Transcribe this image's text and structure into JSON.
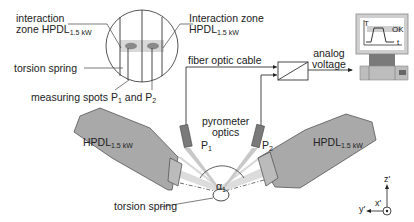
{
  "diagram": {
    "type": "laser welding setup schematic",
    "labels": {
      "interaction_zone_left": "interaction",
      "interaction_zone_left_2": "zone HPDL",
      "interaction_zone_left_sub": "1.5 kW",
      "interaction_zone_right": "Interaction zone",
      "interaction_zone_right_2": "HPDL",
      "interaction_zone_right_sub": "1.5 kW",
      "torsion_spring_top": "torsion spring",
      "measuring_spots": "measuring spots P",
      "measuring_spots_sub1": "1",
      "measuring_spots_and": " and P",
      "measuring_spots_sub2": "2",
      "fiber_optic_cable": "fiber optic cable",
      "analog_voltage_1": "analog",
      "analog_voltage_2": "voltage",
      "pyrometer_optics_1": "pyrometer",
      "pyrometer_optics_2": "optics",
      "p1": "P",
      "p1_sub": "1",
      "p2": "P",
      "p2_sub": "2",
      "laser_left": "HPDL",
      "laser_left_sub": "1.5 kW",
      "laser_right": "HPDL",
      "laser_right_sub": "1.5 kW",
      "angle": "α",
      "angle_sub": "1",
      "torsion_spring_bottom": "torsion spring",
      "monitor_T": "T",
      "monitor_t": "t",
      "monitor_ok": "OK",
      "axis_z": "z'",
      "axis_y": "y'",
      "axis_x": "x'"
    },
    "colors": {
      "laser_body": "#a9a9a9",
      "beam": "#d4d4d4",
      "line": "#333333",
      "spot": "#8a8a8a"
    }
  }
}
